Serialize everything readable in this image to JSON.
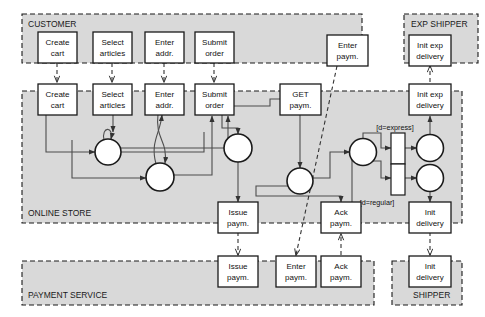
{
  "diagram": {
    "colors": {
      "lane_fill": "#d9d9d9",
      "lane_border": "#1a1a1a",
      "node_fill": "#ffffff",
      "node_border": "#1a1a1a",
      "arc": "#4d4d4d",
      "text": "#111111",
      "background": "#ffffff"
    },
    "lanes": [
      {
        "id": "customer",
        "label": "CUSTOMER",
        "label_pos": "top-left"
      },
      {
        "id": "exp-shipper",
        "label": "EXP SHIPPER",
        "label_pos": "top-right"
      },
      {
        "id": "online-store",
        "label": "ONLINE STORE",
        "label_pos": "bottom-left"
      },
      {
        "id": "payment-service",
        "label": "PAYMENT SERVICE",
        "label_pos": "bottom-left"
      },
      {
        "id": "shipper",
        "label": "SHIPPER",
        "label_pos": "bottom-right"
      }
    ],
    "customer_tasks": [
      {
        "id": "cust-create-cart",
        "line1": "Create",
        "line2": "cart"
      },
      {
        "id": "cust-select-articles",
        "line1": "Select",
        "line2": "articles"
      },
      {
        "id": "cust-enter-addr",
        "line1": "Enter",
        "line2": "addr."
      },
      {
        "id": "cust-submit-order",
        "line1": "Submit",
        "line2": "order"
      },
      {
        "id": "cust-enter-paym",
        "line1": "Enter",
        "line2": "paym."
      }
    ],
    "exp_shipper_tasks": [
      {
        "id": "exp-init-exp-delivery",
        "line1": "Init exp",
        "line2": "delivery"
      }
    ],
    "store_tasks": [
      {
        "id": "store-create-cart",
        "line1": "Create",
        "line2": "cart"
      },
      {
        "id": "store-select-articles",
        "line1": "Select",
        "line2": "articles"
      },
      {
        "id": "store-enter-addr",
        "line1": "Enter",
        "line2": "addr."
      },
      {
        "id": "store-submit-order",
        "line1": "Submit",
        "line2": "order"
      },
      {
        "id": "store-get-paym",
        "line1": "GET",
        "line2": "paym."
      },
      {
        "id": "store-init-exp-delivery",
        "line1": "Init exp",
        "line2": "delivery"
      },
      {
        "id": "store-issue-paym",
        "line1": "Issue",
        "line2": "paym."
      },
      {
        "id": "store-ack-paym",
        "line1": "Ack",
        "line2": "paym."
      },
      {
        "id": "store-init-delivery",
        "line1": "Init",
        "line2": "delivery"
      }
    ],
    "payment_tasks": [
      {
        "id": "pay-issue-paym",
        "line1": "Issue",
        "line2": "paym."
      },
      {
        "id": "pay-enter-paym",
        "line1": "Enter",
        "line2": "paym."
      },
      {
        "id": "pay-ack-paym",
        "line1": "Ack",
        "line2": "paym."
      }
    ],
    "shipper_tasks": [
      {
        "id": "ship-init-delivery",
        "line1": "Init",
        "line2": "delivery"
      }
    ],
    "guards": [
      {
        "id": "guard-express",
        "label": "[d=express]"
      },
      {
        "id": "guard-regular",
        "label": "[d=regular]"
      }
    ],
    "places_count": 7,
    "silent_transitions_count": 2
  }
}
